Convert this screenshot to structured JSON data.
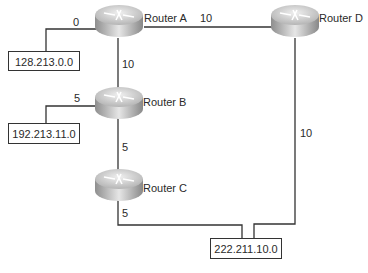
{
  "routers": [
    {
      "id": "A",
      "label": "Router A"
    },
    {
      "id": "B",
      "label": "Router B"
    },
    {
      "id": "C",
      "label": "Router C"
    },
    {
      "id": "D",
      "label": "Router D"
    }
  ],
  "networks": [
    {
      "id": "net1",
      "label": "128.213.0.0"
    },
    {
      "id": "net2",
      "label": "192.213.11.0"
    },
    {
      "id": "net3",
      "label": "222.211.10.0"
    }
  ],
  "links": [
    {
      "from": "Router A",
      "to": "128.213.0.0",
      "cost": "0"
    },
    {
      "from": "Router A",
      "to": "Router D",
      "cost": "10"
    },
    {
      "from": "Router A",
      "to": "Router B",
      "cost": "10"
    },
    {
      "from": "Router B",
      "to": "192.213.11.0",
      "cost": "5"
    },
    {
      "from": "Router B",
      "to": "Router C",
      "cost": "5"
    },
    {
      "from": "Router C",
      "to": "222.211.10.0",
      "cost": "5"
    },
    {
      "from": "Router D",
      "to": "222.211.10.0",
      "cost": "10"
    }
  ],
  "colors": {
    "line": "#333333",
    "router_top": "#d8d8d8",
    "router_side": "#a9a9a9"
  }
}
